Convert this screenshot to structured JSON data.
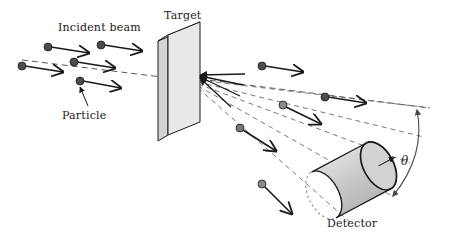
{
  "figure": {
    "title_text": "",
    "domain": "physics scattering experiment schematic",
    "background_color": "#ffffff",
    "line_color": "#1a1a1a",
    "dash_color": "#595959",
    "target_face_color": "#e6e6e6",
    "target_edge_color": "#d2d2d2",
    "detector_body_color": "#c9c9c9",
    "detector_face_color": "#d8d8d8",
    "particle_color": "#4d4d4d"
  },
  "labels": {
    "incident_beam": "Incident beam",
    "particle": "Particle",
    "target": "Target",
    "detector": "Detector",
    "theta": "θ"
  },
  "annotations": {
    "theta_meaning": "scattering angle",
    "beam_axis_note": "horizontal dashed beam axis",
    "leader_note": "Particle label leader line to beam particle"
  },
  "geometry": {
    "beam_axis": {
      "x1": 22,
      "y1": 60,
      "x2": 420,
      "y2": 110
    },
    "scatter_point": {
      "x": 198,
      "y": 76
    },
    "target_plate": {
      "face_points": "168,35 200,22 200,122 168,135",
      "edge_points": "158,41 168,35 168,135 158,141",
      "top_points": "158,41 168,35 200,22 190,28"
    },
    "detector": {
      "cx": 352,
      "cy": 178,
      "rx": 16,
      "ry": 26,
      "length": 62,
      "angle_deg": -28
    },
    "theta_arc": {
      "start": {
        "x": 416,
        "y": 108
      },
      "end": {
        "x": 392,
        "y": 196
      },
      "label_pos": {
        "x": 404,
        "y": 161
      }
    }
  },
  "incident_particles": [
    {
      "id": "p1",
      "dot_x": 22,
      "dot_y": 66,
      "tip_x": 63,
      "tip_y": 72
    },
    {
      "id": "p2",
      "dot_x": 48,
      "dot_y": 47,
      "tip_x": 89,
      "tip_y": 53
    },
    {
      "id": "p3",
      "dot_x": 74,
      "dot_y": 62,
      "tip_x": 115,
      "tip_y": 68
    },
    {
      "id": "p4",
      "dot_x": 101,
      "dot_y": 45,
      "tip_x": 142,
      "tip_y": 51
    },
    {
      "id": "p5",
      "dot_x": 80,
      "dot_y": 81,
      "tip_x": 121,
      "tip_y": 88
    }
  ],
  "scattered_particles": [
    {
      "id": "s1",
      "dot_x": 262,
      "dot_y": 66,
      "tip_x": 303,
      "tip_y": 72
    },
    {
      "id": "s2",
      "dot_x": 325,
      "dot_y": 97,
      "tip_x": 366,
      "tip_y": 103
    },
    {
      "id": "s3",
      "dot_x": 283,
      "dot_y": 105,
      "tip_x": 321,
      "tip_y": 123
    },
    {
      "id": "s4",
      "dot_x": 240,
      "dot_y": 128,
      "tip_x": 276,
      "tip_y": 150
    },
    {
      "id": "s5",
      "dot_x": 262,
      "dot_y": 184,
      "tip_x": 292,
      "tip_y": 214
    }
  ],
  "scatter_rays": [
    {
      "id": "r1",
      "x2": 430,
      "y2": 108
    },
    {
      "id": "r2",
      "x2": 424,
      "y2": 137
    },
    {
      "id": "r3",
      "x2": 410,
      "y2": 163
    },
    {
      "id": "r4",
      "x2": 392,
      "y2": 194
    },
    {
      "id": "r5",
      "x2": 352,
      "y2": 222
    }
  ],
  "converging_arrows": [
    {
      "id": "c1",
      "x1": 245,
      "y1": 74
    },
    {
      "id": "c2",
      "x1": 243,
      "y1": 85
    },
    {
      "id": "c3",
      "x1": 240,
      "y1": 96
    },
    {
      "id": "c4",
      "x1": 232,
      "y1": 107
    }
  ]
}
